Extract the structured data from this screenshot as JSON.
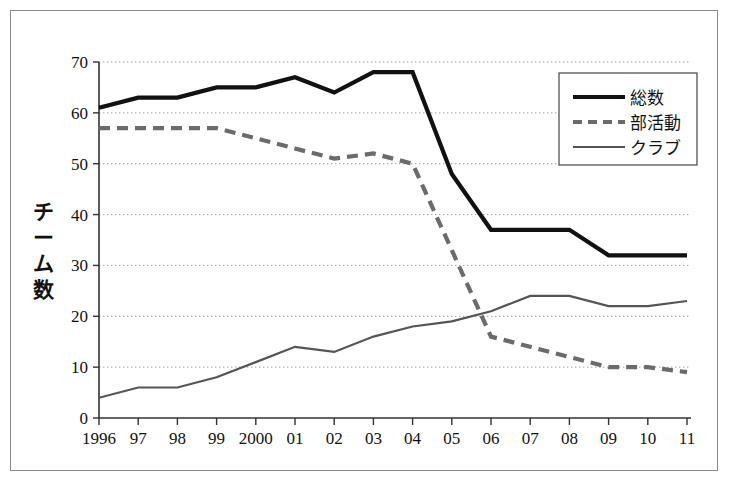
{
  "chart_data": {
    "type": "line",
    "title": "",
    "xlabel": "",
    "ylabel": "チーム数",
    "ylabel_chars": [
      "チ",
      "ー",
      "ム",
      "数"
    ],
    "categories": [
      "1996",
      "97",
      "98",
      "99",
      "2000",
      "01",
      "02",
      "03",
      "04",
      "05",
      "06",
      "07",
      "08",
      "09",
      "10",
      "11"
    ],
    "xtick_labels": [
      "1996",
      "97",
      "98",
      "99",
      "2000",
      "01",
      "02",
      "03",
      "04",
      "05",
      "06",
      "07",
      "08",
      "09",
      "10",
      "11"
    ],
    "ytick_labels": [
      "0",
      "10",
      "20",
      "30",
      "40",
      "50",
      "60",
      "70"
    ],
    "ytick_values": [
      0,
      10,
      20,
      30,
      40,
      50,
      60,
      70
    ],
    "ylim": [
      0,
      70
    ],
    "grid": "horizontal-dotted",
    "legend_position": "top-right",
    "series": [
      {
        "name": "総数",
        "style": "solid-thick",
        "color": "#111111",
        "values": [
          61,
          63,
          63,
          65,
          65,
          67,
          64,
          68,
          68,
          48,
          37,
          37,
          37,
          32,
          32,
          32
        ]
      },
      {
        "name": "部活動",
        "style": "dashed",
        "color": "#6b6b6b",
        "values": [
          57,
          57,
          57,
          57,
          55,
          53,
          51,
          52,
          50,
          33,
          16,
          14,
          12,
          10,
          10,
          9
        ]
      },
      {
        "name": "クラブ",
        "style": "solid-thin",
        "color": "#555555",
        "values": [
          4,
          6,
          6,
          8,
          11,
          14,
          13,
          16,
          18,
          19,
          21,
          24,
          24,
          22,
          22,
          23
        ]
      }
    ]
  },
  "legend": {
    "entries": [
      {
        "label": "総数",
        "swatch": "solid-thick"
      },
      {
        "label": "部活動",
        "swatch": "dashed"
      },
      {
        "label": "クラブ",
        "swatch": "solid-thin"
      }
    ]
  }
}
